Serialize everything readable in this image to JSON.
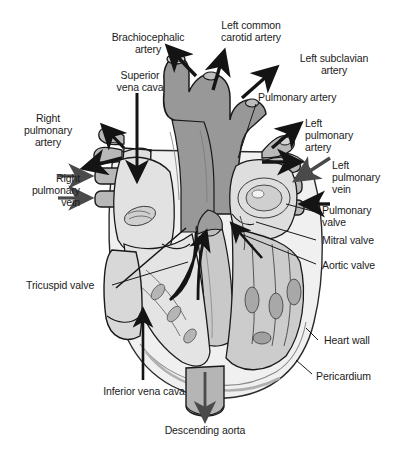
{
  "figure": {
    "kind": "anatomical-diagram",
    "width": 399,
    "height": 452,
    "background": "#ffffff"
  },
  "palette": {
    "ink": "#1b1b1b",
    "outline": "#111111",
    "aorta_dark_gray": "#989898",
    "vessel_mid_gray": "#b4b4b4",
    "chamber_light_gray": "#dcdcdc",
    "muscle_gray": "#c6c6c6",
    "highlight_white": "#f2f2f2",
    "arrow_dark": "#141414",
    "arrow_mid": "#4a4a4a"
  },
  "labels": [
    {
      "id": "brachiocephalic-artery",
      "text": "Brachiocephalic\nartery",
      "x": 148,
      "y": 37,
      "align": "center"
    },
    {
      "id": "left-common-carotid-artery",
      "text": "Left common\ncarotid artery",
      "x": 251,
      "y": 25,
      "align": "center"
    },
    {
      "id": "left-subclavian-artery",
      "text": "Left subclavian\nartery",
      "x": 334,
      "y": 58,
      "align": "center"
    },
    {
      "id": "superior-vena-cava",
      "text": "Superior\nvena cava",
      "x": 140,
      "y": 75,
      "align": "center"
    },
    {
      "id": "pulmonary-artery",
      "text": "Pulmonary artery",
      "x": 308,
      "y": 97,
      "align": "center"
    },
    {
      "id": "right-pulmonary-artery",
      "text": "Right\npulmonary\nartery",
      "x": 47,
      "y": 118,
      "align": "center"
    },
    {
      "id": "left-pulmonary-artery",
      "text": "Left\npulmonary\nartery",
      "x": 354,
      "y": 123,
      "align": "center"
    },
    {
      "id": "left-pulmonary-vein",
      "text": "Left\npulmonary\nvein",
      "x": 355,
      "y": 165,
      "align": "center"
    },
    {
      "id": "right-pulmonary-vein",
      "text": "Right\npulmonary\nvein",
      "x": 40,
      "y": 178,
      "align": "center"
    },
    {
      "id": "pulmonary-valve",
      "text": "Pulmonary\nvalve",
      "x": 354,
      "y": 210,
      "align": "center"
    },
    {
      "id": "mitral-valve",
      "text": "Mitral valve",
      "x": 356,
      "y": 240,
      "align": "center"
    },
    {
      "id": "aortic-valve",
      "text": "Aortic valve",
      "x": 356,
      "y": 265,
      "align": "center"
    },
    {
      "id": "tricuspid-valve",
      "text": "Tricuspid valve",
      "x": 70,
      "y": 285,
      "align": "center"
    },
    {
      "id": "heart-wall",
      "text": "Heart wall",
      "x": 354,
      "y": 340,
      "align": "center"
    },
    {
      "id": "pericardium",
      "text": "Pericardium",
      "x": 350,
      "y": 376,
      "align": "center"
    },
    {
      "id": "inferior-vena-cava",
      "text": "Inferior vena cava",
      "x": 143,
      "y": 391,
      "align": "center"
    },
    {
      "id": "descending-aorta",
      "text": "Descending aorta",
      "x": 204,
      "y": 430,
      "align": "center"
    }
  ],
  "structures": [
    {
      "id": "aortic-arch",
      "name": "Aortic arch / ascending aorta",
      "shade": "dark-gray"
    },
    {
      "id": "superior-vena-cava-vessel",
      "name": "Superior vena cava",
      "shade": "light-gray"
    },
    {
      "id": "right-pulmonary-artery-vessel",
      "name": "Right pulmonary artery stump",
      "shade": "mid-gray"
    },
    {
      "id": "right-pulmonary-veins",
      "name": "Right pulmonary veins (two stumps)",
      "shade": "mid-gray"
    },
    {
      "id": "left-pulmonary-artery-vessel",
      "name": "Left pulmonary artery stump",
      "shade": "mid-gray"
    },
    {
      "id": "left-pulmonary-veins",
      "name": "Left pulmonary veins (two stumps)",
      "shade": "mid-gray"
    },
    {
      "id": "right-atrium",
      "name": "Right atrium",
      "shade": "light-gray"
    },
    {
      "id": "left-atrium",
      "name": "Left atrium",
      "shade": "light-gray"
    },
    {
      "id": "right-ventricle",
      "name": "Right ventricle",
      "shade": "light-gray"
    },
    {
      "id": "left-ventricle",
      "name": "Left ventricle",
      "shade": "muscle-gray"
    },
    {
      "id": "interventricular-septum",
      "name": "Interventricular septum",
      "shade": "muscle-gray"
    },
    {
      "id": "descending-aorta-vessel",
      "name": "Descending aorta",
      "shade": "mid-gray"
    },
    {
      "id": "inferior-vena-cava-vessel",
      "name": "Inferior vena cava",
      "shade": "light-gray"
    },
    {
      "id": "pericardium-layer",
      "name": "Pericardium (outer envelope)",
      "shade": "highlight-white"
    }
  ],
  "flow_arrows": [
    {
      "id": "arrow-brachiocephalic",
      "direction": "up-left",
      "style": "solid-dark"
    },
    {
      "id": "arrow-left-common-carotid",
      "direction": "up",
      "style": "solid-dark"
    },
    {
      "id": "arrow-left-subclavian",
      "direction": "up-right",
      "style": "solid-dark"
    },
    {
      "id": "arrow-superior-vena-cava",
      "direction": "down",
      "style": "solid-dark"
    },
    {
      "id": "arrow-right-pulmonary-artery-upper",
      "direction": "up-left",
      "style": "solid-dark"
    },
    {
      "id": "arrow-right-pulmonary-artery-lower",
      "direction": "left",
      "style": "solid-dark"
    },
    {
      "id": "arrow-right-pulmonary-vein-upper",
      "direction": "right",
      "style": "solid-dark"
    },
    {
      "id": "arrow-right-pulmonary-vein-lower",
      "direction": "right",
      "style": "solid-dark"
    },
    {
      "id": "arrow-left-pulmonary-artery-up",
      "direction": "up-right",
      "style": "solid-dark"
    },
    {
      "id": "arrow-left-pulmonary-artery-right",
      "direction": "right",
      "style": "solid-dark"
    },
    {
      "id": "arrow-left-pulmonary-vein-upper",
      "direction": "down-left",
      "style": "solid-gray"
    },
    {
      "id": "arrow-left-pulmonary-vein-lower",
      "direction": "left",
      "style": "solid-dark"
    },
    {
      "id": "arrow-inferior-vena-cava",
      "direction": "up",
      "style": "solid-dark"
    },
    {
      "id": "arrow-descending-aorta",
      "direction": "down",
      "style": "solid-gray"
    },
    {
      "id": "arrow-right-atrium-to-ventricle",
      "direction": "down-right-curve",
      "style": "solid-dark"
    },
    {
      "id": "arrow-left-ventricle-to-aorta",
      "direction": "up-left",
      "style": "solid-dark"
    },
    {
      "id": "arrow-septum-up",
      "direction": "up",
      "style": "solid-dark"
    }
  ]
}
